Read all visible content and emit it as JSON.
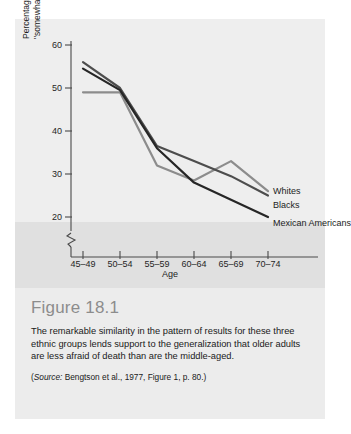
{
  "figure": {
    "number_label": "Figure 18.1",
    "caption": "The remarkable similarity in the pattern of results for these three ethnic groups lends support to the generalization that older adults are less afraid of death than are the middle-aged.",
    "source_prefix": "(",
    "source_word": "Source:",
    "source_rest": " Bengtson et al., 1977, Figure 1, p. 80.)"
  },
  "chart_data": {
    "type": "line",
    "title": "",
    "xlabel": "Age",
    "ylabel": "Percentage \"very afraid\" or \"somewhat afraid\" of death",
    "ylabel_line1": "Percentage \"very afraid\" or",
    "ylabel_line2": "\"somewhat afraid\" of death",
    "categories": [
      "45–49",
      "50–54",
      "55–59",
      "60–64",
      "65–69",
      "70–74"
    ],
    "yticks": [
      20,
      30,
      40,
      50,
      60
    ],
    "ylim": [
      18,
      62
    ],
    "axis_break": true,
    "grid": false,
    "legend_position": "right-inline",
    "series": [
      {
        "name": "Whites",
        "color": "#8c8c8c",
        "values": [
          49,
          49,
          32,
          28.5,
          33,
          26
        ]
      },
      {
        "name": "Blacks",
        "color": "#4d4d4d",
        "values": [
          56,
          50,
          36.5,
          33,
          29.5,
          25
        ]
      },
      {
        "name": "Mexican Americans",
        "name_line1": "Mexican",
        "name_line2": "Americans",
        "color": "#262626",
        "values": [
          54.5,
          49.5,
          36,
          28,
          24,
          20
        ]
      }
    ]
  },
  "axis_tick_labels": {
    "y": [
      "60",
      "50",
      "40",
      "30",
      "20"
    ],
    "x": [
      "45–49",
      "50–54",
      "55–59",
      "60–64",
      "65–69",
      "70–74"
    ]
  },
  "colors": {
    "panel_bg": "#eeeeee",
    "tint_band": "#e0e0e0",
    "caption_bg": "#ececec",
    "axis": "#4a4a4a",
    "figure_number": "#8c8c8c"
  }
}
